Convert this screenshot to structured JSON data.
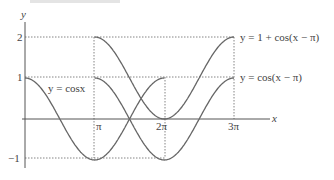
{
  "chart_data": {
    "type": "line",
    "title": "",
    "xlabel": "x",
    "ylabel": "y",
    "x_ticks": [
      "π",
      "2π",
      "3π"
    ],
    "y_ticks": [
      "2",
      "1",
      "−1"
    ],
    "xlim": [
      0,
      9.42
    ],
    "ylim": [
      -1,
      2
    ],
    "grid": false,
    "series": [
      {
        "name": "y = cos x",
        "domain": [
          0,
          6.283
        ],
        "values_at": {
          "0": 1,
          "π": -1,
          "2π": 1
        }
      },
      {
        "name": "y = cos(x − π)",
        "domain": [
          3.1416,
          9.425
        ],
        "values_at": {
          "π": 1,
          "2π": -1,
          "3π": 1
        }
      },
      {
        "name": "y = 1 + cos(x − π)",
        "domain": [
          3.1416,
          9.425
        ],
        "values_at": {
          "π": 2,
          "2π": 0,
          "3π": 2
        }
      }
    ]
  },
  "labels": {
    "y_axis": "y",
    "x_axis": "x",
    "tick_pi": "π",
    "tick_2pi": "2π",
    "tick_3pi": "3π",
    "tick_2": "2",
    "tick_1": "1",
    "tick_neg1": "−1",
    "curve_cos": "y = cosx",
    "curve_shift": "y = cos(x − π)",
    "curve_shift_up": "y = 1 + cos(x − π)"
  }
}
